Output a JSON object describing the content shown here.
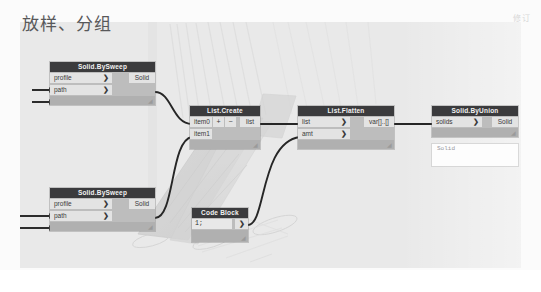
{
  "page": {
    "title": "放样、分组",
    "watermark": "修订"
  },
  "canvas": {
    "background_color": "#e9e9e9",
    "node_header_color": "#3b3b3d",
    "node_body_color": "#bdbdbd",
    "port_color": "#e3e3e3",
    "wire_color": "#262626"
  },
  "nodes": [
    {
      "id": "solid-bysweep-top",
      "title": "Solid.BySweep",
      "inputs": [
        {
          "label": "profile",
          "chevron": "❯"
        },
        {
          "label": "path",
          "chevron": "❯"
        }
      ],
      "outputs": [
        {
          "label": "Solid"
        }
      ]
    },
    {
      "id": "solid-bysweep-bottom",
      "title": "Solid.BySweep",
      "inputs": [
        {
          "label": "profile",
          "chevron": "❯"
        },
        {
          "label": "path",
          "chevron": "❯"
        }
      ],
      "outputs": [
        {
          "label": "Solid"
        }
      ]
    },
    {
      "id": "list-create",
      "title": "List.Create",
      "inputs": [
        {
          "label": "item0"
        },
        {
          "label": "item1"
        }
      ],
      "buttons": [
        {
          "label": "+",
          "name": "add-input-button"
        },
        {
          "label": "−",
          "name": "remove-input-button"
        }
      ],
      "outputs": [
        {
          "label": "list"
        }
      ]
    },
    {
      "id": "list-flatten",
      "title": "List.Flatten",
      "inputs": [
        {
          "label": "list",
          "chevron": "❯"
        },
        {
          "label": "amt",
          "chevron": "❯"
        }
      ],
      "outputs": [
        {
          "label": "var[]..[]"
        }
      ]
    },
    {
      "id": "code-block",
      "title": "Code Block",
      "code": "1;",
      "outputs": [
        {
          "label": "❯"
        }
      ]
    },
    {
      "id": "solid-byunion",
      "title": "Solid.ByUnion",
      "inputs": [
        {
          "label": "solids",
          "chevron": "❯"
        }
      ],
      "outputs": [
        {
          "label": "Solid"
        }
      ]
    }
  ],
  "preview": {
    "label": "Solid"
  },
  "geometry_preview": {
    "description": "swept-solid-3d-preview"
  }
}
